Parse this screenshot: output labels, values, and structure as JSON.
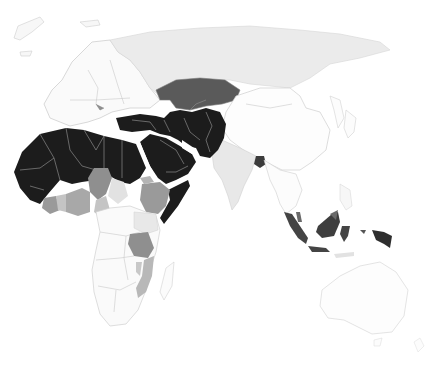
{
  "map": {
    "type": "choropleth",
    "projection": "equirectangular-cropped",
    "region_shown": "Europe, Africa, Asia, Oceania",
    "palette": {
      "background": "#ffffff",
      "none": "#fbfbfb",
      "very_low": "#efefef",
      "low": "#e6e6e6",
      "medium_low": "#b4b4b4",
      "medium": "#8f8f8f",
      "high": "#555555",
      "very_high": "#1c1c1c",
      "border": "#c9c9c9"
    },
    "classes": [
      {
        "level": "very_high",
        "regions": [
          "North Africa",
          "Sahel (Mali, Niger, Chad, Sudan, Mauritania, Senegal)",
          "Arabian Peninsula",
          "Turkey",
          "Iran",
          "Iraq",
          "Afghanistan",
          "Pakistan",
          "Central Asian republics (south)",
          "Somalia",
          "Egypt",
          "Libya"
        ]
      },
      {
        "level": "high",
        "regions": [
          "Kazakhstan",
          "Bangladesh",
          "Indonesia",
          "Malaysia (Borneo)",
          "Brunei"
        ]
      },
      {
        "level": "medium",
        "regions": [
          "Nigeria",
          "Ethiopia",
          "Tanzania",
          "Burkina Faso",
          "Guinea-Bissau",
          "Sierra Leone",
          "Côte d'Ivoire"
        ]
      },
      {
        "level": "medium_low",
        "regions": [
          "Mozambique",
          "Ghana",
          "Cameroon",
          "Malawi",
          "Eritrea"
        ]
      },
      {
        "level": "low",
        "regions": [
          "Russia",
          "India",
          "Kenya",
          "Uganda",
          "Central African Republic"
        ]
      },
      {
        "level": "very_low",
        "regions": [
          "Europe",
          "China",
          "Mongolia",
          "Southeast Asia mainland",
          "Southern Africa",
          "Australia",
          "Japan"
        ]
      }
    ]
  }
}
